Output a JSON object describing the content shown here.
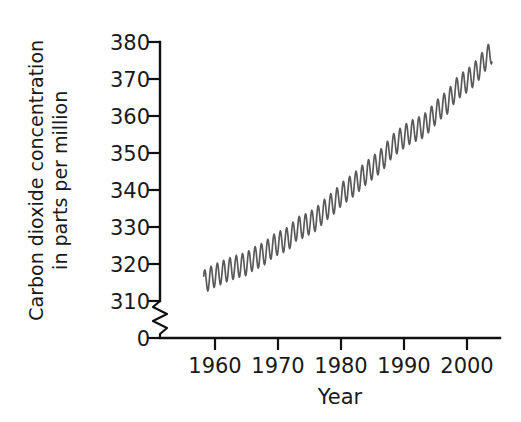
{
  "chart_data": {
    "type": "line",
    "title": "",
    "subtitle": "",
    "xlabel": "Year",
    "ylabel": "Carbon dioxide concentration in parts per million",
    "ylabel_lines": [
      "Carbon dioxide concentration",
      "in parts per million"
    ],
    "xlim": [
      1955.5,
      2004.5
    ],
    "ylim": [
      308.5,
      381.0
    ],
    "y_axis_break": {
      "present": true,
      "from": 0,
      "to": 310,
      "style": "zigzag"
    },
    "grid": false,
    "legend": false,
    "legend_position": "none",
    "line_color": "#5a5a5a",
    "axis_color": "#111111",
    "background_color": "#ffffff",
    "xticks": [
      1960,
      1970,
      1980,
      1990,
      2000
    ],
    "xtick_labels": [
      "1960",
      "1970",
      "1980",
      "1990",
      "2000"
    ],
    "yticks": [
      0,
      310,
      320,
      330,
      340,
      350,
      360,
      370,
      380
    ],
    "ytick_labels": [
      "0",
      "310",
      "320",
      "330",
      "340",
      "350",
      "360",
      "370",
      "380"
    ],
    "series": [
      {
        "name": "Atmospheric CO2 (Mauna Loa)",
        "description": "Monthly mean CO2 concentration showing rising trend with annual seasonal oscillation",
        "seasonal_amplitude_ppm": 3.1,
        "x": [
          1958.2,
          1959,
          1960,
          1961,
          1962,
          1963,
          1964,
          1965,
          1966,
          1967,
          1968,
          1969,
          1970,
          1971,
          1972,
          1973,
          1974,
          1975,
          1976,
          1977,
          1978,
          1979,
          1980,
          1981,
          1982,
          1983,
          1984,
          1985,
          1986,
          1987,
          1988,
          1989,
          1990,
          1991,
          1992,
          1993,
          1994,
          1995,
          1996,
          1997,
          1998,
          1999,
          2000,
          2001,
          2002,
          2003,
          2004
        ],
        "annual_mean": [
          315.2,
          315.9,
          316.9,
          317.6,
          318.4,
          319.0,
          319.6,
          320.0,
          321.3,
          322.1,
          323.0,
          324.6,
          325.6,
          326.3,
          327.4,
          329.6,
          330.1,
          331.1,
          332.0,
          333.8,
          335.4,
          336.8,
          338.7,
          340.1,
          341.4,
          343.0,
          344.6,
          346.0,
          347.4,
          349.2,
          351.6,
          353.1,
          354.4,
          355.6,
          356.4,
          357.1,
          358.8,
          360.8,
          362.6,
          363.8,
          366.6,
          368.3,
          369.5,
          371.0,
          373.1,
          375.6,
          377.4
        ]
      }
    ]
  },
  "axis_geometry": {
    "plot_left_px": 160,
    "plot_right_px": 500,
    "y_top_px": 42,
    "y_310_px": 301,
    "x_axis_px": 338,
    "px_per_10ppm": 37,
    "px_per_decade": 63,
    "x_1960_px": 215
  }
}
